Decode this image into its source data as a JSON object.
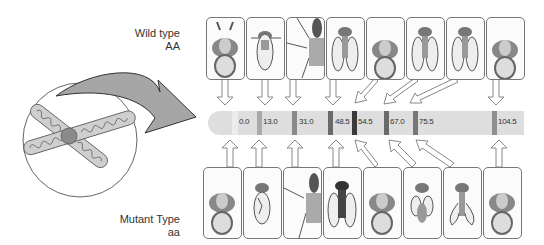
{
  "labels": {
    "wild": {
      "line1": "Wild type",
      "line2": "AA"
    },
    "mutant": {
      "line1": "Mutant Type",
      "line2": "aa"
    }
  },
  "chromosome_map": {
    "loci": [
      {
        "position": "0.0",
        "band_color": "#e8e8e8",
        "wild_trait": "aristae-antenna",
        "mutant_trait": "antenna"
      },
      {
        "position": "13.0",
        "band_color": "#a9a9a9",
        "wild_trait": "normal-body",
        "mutant_trait": "hairy-body"
      },
      {
        "position": "31.0",
        "band_color": "#8a8a8a",
        "wild_trait": "leg",
        "mutant_trait": "leg"
      },
      {
        "position": "48.5",
        "band_color": "#6a6a6a",
        "wild_trait": "normal-wings",
        "mutant_trait": "dark-body"
      },
      {
        "position": "54.5",
        "band_color": "#3a3a3a",
        "wild_trait": "head-eyes",
        "mutant_trait": "head-eyes"
      },
      {
        "position": "67.0",
        "band_color": "#6a6a6a",
        "wild_trait": "normal-wings",
        "mutant_trait": "vestigial-wings"
      },
      {
        "position": "75.5",
        "band_color": "#777777",
        "wild_trait": "normal-wings",
        "mutant_trait": "curly-wings"
      },
      {
        "position": "104.5",
        "band_color": "#8f8f8f",
        "wild_trait": "head-eyes",
        "mutant_trait": "head-eyes"
      }
    ]
  },
  "colors": {
    "bar": "#dedede",
    "arrow": "#a6a6a6",
    "box_border": "#777777"
  }
}
